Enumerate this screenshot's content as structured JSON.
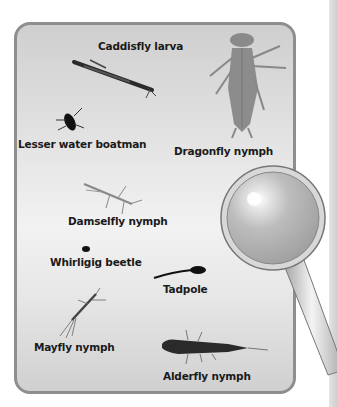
{
  "figure": {
    "creatures": [
      {
        "label": "Caddisfly larva"
      },
      {
        "label": "Lesser water boatman"
      },
      {
        "label": "Dragonfly nymph"
      },
      {
        "label": "Damselfly nymph"
      },
      {
        "label": "Whirligig beetle"
      },
      {
        "label": "Tadpole"
      },
      {
        "label": "Mayfly nymph"
      },
      {
        "label": "Alderfly nymph"
      }
    ]
  }
}
